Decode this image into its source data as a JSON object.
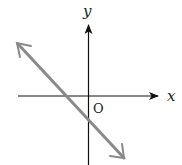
{
  "diagram": {
    "type": "coordinate-plane-line",
    "axes": {
      "x_label": "x",
      "y_label": "y",
      "origin_label": "O"
    },
    "line": {
      "description": "line with negative slope, negative x-intercept and negative y-intercept",
      "color": "#8a8a8a"
    },
    "colors": {
      "axis": "#111111",
      "line": "#8a8a8a",
      "background": "#ffffff"
    }
  }
}
